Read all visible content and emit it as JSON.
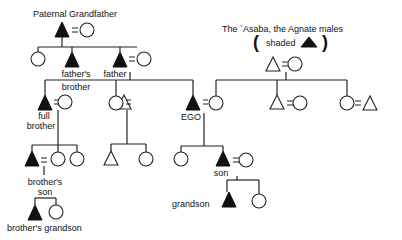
{
  "title": "Paternal Grandfather",
  "legend": {
    "line1": "The `Asaba, the Agnate males",
    "open_paren": "(",
    "shaded_label": "shaded",
    "close_paren": ")"
  },
  "labels": {
    "fathers_brother_1": "father's",
    "fathers_brother_2": "brother",
    "father": "father",
    "full_brother_1": "full",
    "full_brother_2": "brother",
    "ego": "EGO",
    "brothers_son_1": "brother's",
    "brothers_son_2": "son",
    "son": "son",
    "grandson": "grandson",
    "brothers_grandson": "brother's grandson"
  },
  "colors": {
    "shaded": "#111111",
    "line": "#222222"
  }
}
